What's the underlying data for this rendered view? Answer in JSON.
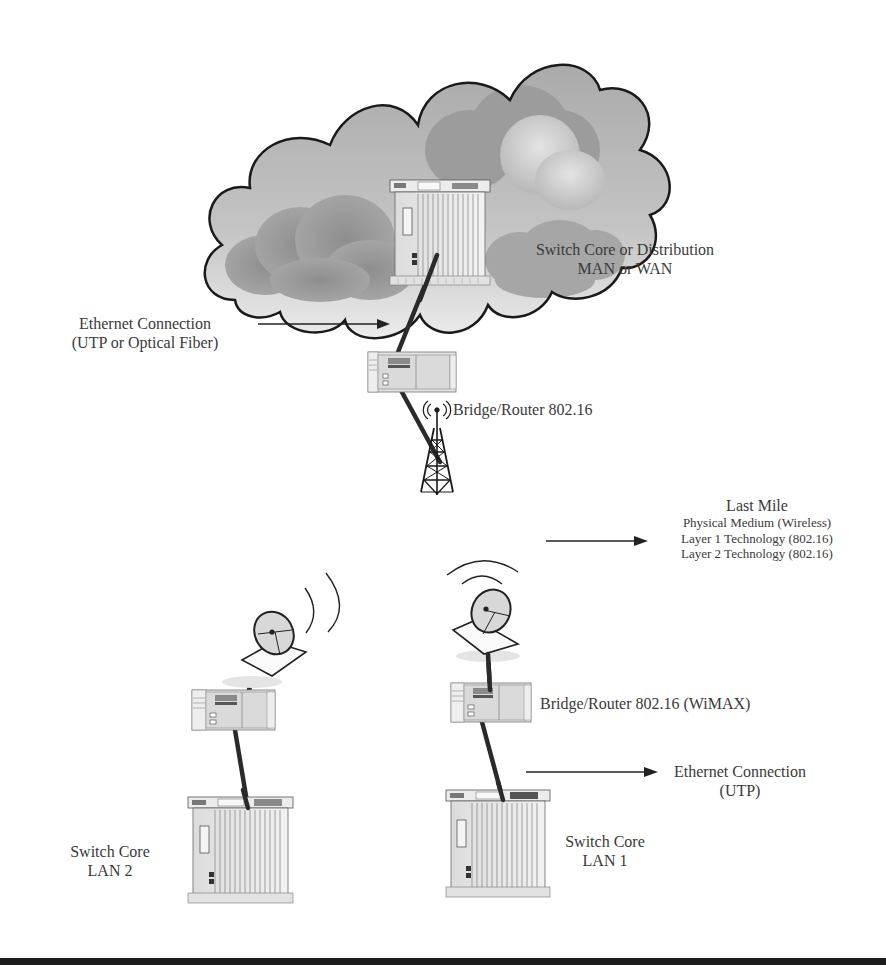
{
  "diagram": {
    "type": "network-topology",
    "cloud": {
      "label_line1": "Switch Core or Distribution",
      "label_line2": "MAN or WAN"
    },
    "ethernet_top": {
      "line1": "Ethernet Connection",
      "line2": "(UTP or Optical Fiber)"
    },
    "base_station": {
      "label": "Bridge/Router 802.16"
    },
    "last_mile": {
      "title": "Last Mile",
      "lines": [
        "Physical Medium (Wireless)",
        "Layer 1 Technology (802.16)",
        "Layer 2 Technology (802.16)"
      ]
    },
    "subscriber_router": {
      "label": "Bridge/Router 802.16 (WiMAX)"
    },
    "ethernet_bottom": {
      "line1": "Ethernet Connection",
      "line2": "(UTP)"
    },
    "lan1": {
      "line1": "Switch Core",
      "line2": "LAN 1"
    },
    "lan2": {
      "line1": "Switch Core",
      "line2": "LAN 2"
    },
    "nodes": [
      {
        "id": "core-switch",
        "icon": "chassis-switch-icon"
      },
      {
        "id": "cloud-router",
        "icon": "router-icon"
      },
      {
        "id": "tower",
        "icon": "radio-tower-icon"
      },
      {
        "id": "dish-lan2",
        "icon": "satellite-dish-icon"
      },
      {
        "id": "router-lan2",
        "icon": "router-icon"
      },
      {
        "id": "switch-lan2",
        "icon": "chassis-switch-icon"
      },
      {
        "id": "dish-lan1",
        "icon": "satellite-dish-icon"
      },
      {
        "id": "router-lan1",
        "icon": "router-icon"
      },
      {
        "id": "switch-lan1",
        "icon": "chassis-switch-icon"
      }
    ],
    "colors": {
      "cloud_outline": "#1a1a1a",
      "cloud_fill_light": "#e6e6e6",
      "cloud_fill_dark": "#9a9a9a",
      "link": "#2a2a2a",
      "text": "#3a3a3a",
      "bottom_bar": "#1c1c1c"
    }
  }
}
